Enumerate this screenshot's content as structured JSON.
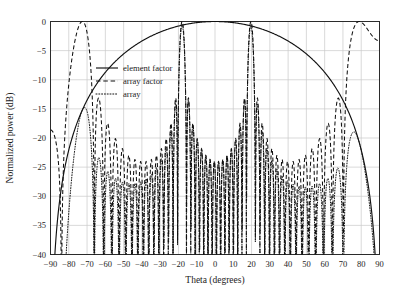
{
  "chart_data": {
    "type": "line",
    "title": "",
    "xlabel": "Theta (degrees)",
    "ylabel": "Normalized power (dB)",
    "xlim": [
      -90,
      90
    ],
    "ylim": [
      -40,
      0
    ],
    "xticks": [
      -90,
      -80,
      -70,
      -60,
      -50,
      -40,
      -30,
      -20,
      -10,
      0,
      10,
      20,
      30,
      40,
      50,
      60,
      70,
      80,
      90
    ],
    "xtick_labels": [
      "−90",
      "−80",
      "−70",
      "−60",
      "−50",
      "−40",
      "−30",
      "−20",
      "−10",
      "0",
      "10",
      "20",
      "30",
      "40",
      "50",
      "60",
      "70",
      "80",
      "90"
    ],
    "yticks": [
      0,
      -5,
      -10,
      -15,
      -20,
      -25,
      -30,
      -35,
      -40
    ],
    "ytick_labels": [
      "0",
      "−5",
      "−10",
      "−15",
      "−20",
      "−25",
      "−30",
      "−35",
      "−40"
    ],
    "grid": true,
    "legend_position": "upper-left-inside",
    "legend": [
      "element factor",
      "array factor",
      "array"
    ],
    "series": [
      {
        "name": "element factor",
        "style": "solid",
        "color": "#111111",
        "description": "Smooth broad cosine-shaped element pattern, peak 0 dB at 0 degrees, falling to about -35 dB at the +/-90 degree edges.",
        "model": "element_cos_power",
        "model_params": {
          "peak_db": 0.0,
          "exponent": 1.45,
          "edge_db": -35.0
        }
      },
      {
        "name": "array factor",
        "style": "dashed",
        "color": "#111111",
        "description": "Periodic array factor with two grating lobes reaching 0 dB at about -18 and +29 degrees, plus dense sidelobes falling below -40 dB.",
        "model": "array_factor_sinc",
        "model_params": {
          "num_elements": 16,
          "element_spacing_lambda": 1.55,
          "scan_peaks_deg": [
            -18,
            29
          ]
        }
      },
      {
        "name": "array",
        "style": "dotted",
        "color": "#111111",
        "description": "Product of element factor and array factor shown only in the far sidelobe region; lobe peaks around -23 dB near -73 degrees and -28 dB near 71 degrees.",
        "model": "product",
        "model_params": {
          "offset_db": -23.0
        }
      }
    ],
    "annotations": [
      {
        "text": "grating lobe",
        "theta_deg": -18,
        "value_db": 0
      },
      {
        "text": "grating lobe",
        "theta_deg": 29,
        "value_db": 0
      }
    ]
  },
  "axes": {
    "x_title": "Theta (degrees)",
    "y_title": "Normalized power (dB)"
  },
  "legend": {
    "items": [
      {
        "label": "element factor",
        "style": "solid"
      },
      {
        "label": "array factor",
        "style": "dashed"
      },
      {
        "label": "array",
        "style": "dotted"
      }
    ]
  },
  "colors": {
    "background": "#ffffff",
    "frame": "#2b2b2b",
    "grid": "#c9c9c9",
    "line": "#111111"
  }
}
